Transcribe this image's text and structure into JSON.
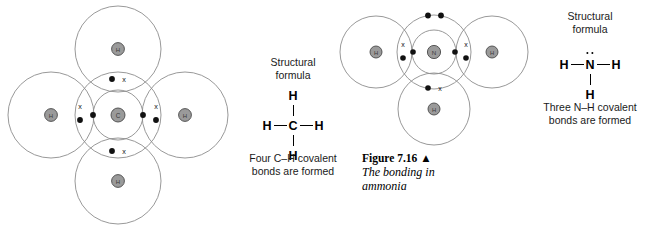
{
  "figure": {
    "label": "Figure 7.16 ▲",
    "text": "The bonding in\nammonia"
  },
  "methane": {
    "diagram": {
      "central_atom": "C",
      "outer_atoms": [
        "H",
        "H",
        "H",
        "H"
      ],
      "shared_pair_marks": [
        "•",
        "x"
      ],
      "bond_count": 4
    },
    "structural_formula_title": "Structural\nformula",
    "formula": {
      "top": "H",
      "left": "H",
      "center": "C",
      "right": "H",
      "bottom": "H"
    },
    "note": "Four C–H covalent\nbonds are formed"
  },
  "ammonia": {
    "diagram": {
      "central_atom": "N",
      "outer_atoms": [
        "H",
        "H",
        "H"
      ],
      "shared_pair_marks": [
        "•",
        "x"
      ],
      "lone_pair_marks": [
        "•",
        "•"
      ],
      "bond_count": 3
    },
    "structural_formula_title": "Structural\nformula",
    "formula": {
      "left": "H",
      "center": "N",
      "right": "H",
      "bottom": "H"
    },
    "note": "Three N–H covalent\nbonds are formed"
  },
  "style": {
    "shell_stroke": "#8d8d8d",
    "nucleus_fill": "#9a9a9a",
    "nucleus_stroke": "#4a4a4a",
    "electron_fill": "#111111",
    "text_color": "#1a1a1a"
  }
}
